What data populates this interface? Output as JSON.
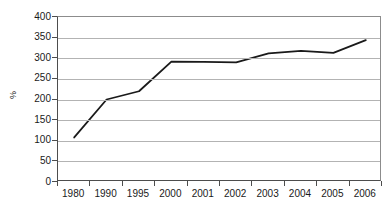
{
  "chart_data": {
    "type": "line",
    "title": "",
    "subtitle": "",
    "xlabel": "",
    "ylabel": "%",
    "categories": [
      "1980",
      "1990",
      "1995",
      "2000",
      "2001",
      "2002",
      "2003",
      "2004",
      "2005",
      "2006"
    ],
    "series": [
      {
        "name": "series-1",
        "values": [
          108,
          200,
          220,
          292,
          291,
          290,
          312,
          318,
          313,
          344
        ],
        "color": "#1a1a1a"
      }
    ],
    "ylim": [
      0,
      400
    ],
    "ytick_values": [
      0,
      50,
      100,
      150,
      200,
      250,
      300,
      350,
      400
    ],
    "ytick_labels": [
      "0",
      "50",
      "100",
      "150",
      "200",
      "250",
      "300",
      "350",
      "400"
    ],
    "grid": "horizontal",
    "grid_color": "#b3b3b3",
    "legend": "none",
    "legend_position": "",
    "annotations": [],
    "axis_color": "#4d4d4d",
    "plot_background": "#ffffff"
  }
}
